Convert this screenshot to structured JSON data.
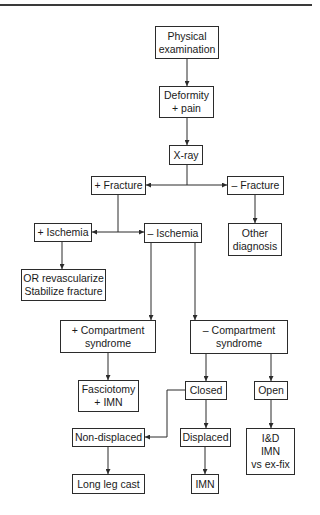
{
  "diagram": {
    "type": "flowchart",
    "colors": {
      "line": "#2b2b2b",
      "box_border": "#2b2b2b",
      "text": "#1a1a1a",
      "background": "#ffffff"
    },
    "nodes": {
      "physical_exam": {
        "lines": [
          "Physical",
          "examination"
        ]
      },
      "deformity": {
        "lines": [
          "Deformity",
          "+ pain"
        ]
      },
      "xray": {
        "lines": [
          "X-ray"
        ]
      },
      "pos_fracture": {
        "lines": [
          "+ Fracture"
        ]
      },
      "neg_fracture": {
        "lines": [
          "– Fracture"
        ]
      },
      "other_diagnosis": {
        "lines": [
          "Other",
          "diagnosis"
        ]
      },
      "pos_ischemia": {
        "lines": [
          "+ Ischemia"
        ]
      },
      "neg_ischemia": {
        "lines": [
          "– Ischemia"
        ]
      },
      "or_revascularize": {
        "lines": [
          "OR revascularize",
          "Stabilize fracture"
        ]
      },
      "pos_compartment": {
        "lines": [
          "+ Compartment",
          "syndrome"
        ]
      },
      "neg_compartment": {
        "lines": [
          "– Compartment",
          "syndrome"
        ]
      },
      "fasciotomy": {
        "lines": [
          "Fasciotomy",
          "+ IMN"
        ]
      },
      "closed": {
        "lines": [
          "Closed"
        ]
      },
      "open": {
        "lines": [
          "Open"
        ]
      },
      "non_displaced": {
        "lines": [
          "Non-displaced"
        ]
      },
      "displaced": {
        "lines": [
          "Displaced"
        ]
      },
      "id_imn": {
        "lines": [
          "I&D",
          "IMN",
          "vs ex-fix"
        ]
      },
      "long_leg_cast": {
        "lines": [
          "Long leg cast"
        ]
      },
      "imn": {
        "lines": [
          "IMN"
        ]
      }
    },
    "edges": [
      {
        "from": "physical_exam",
        "to": "deformity"
      },
      {
        "from": "deformity",
        "to": "xray"
      },
      {
        "from": "xray",
        "to": "pos_fracture"
      },
      {
        "from": "xray",
        "to": "neg_fracture"
      },
      {
        "from": "neg_fracture",
        "to": "other_diagnosis"
      },
      {
        "from": "pos_fracture",
        "to": "pos_ischemia"
      },
      {
        "from": "pos_fracture",
        "to": "neg_ischemia"
      },
      {
        "from": "pos_ischemia",
        "to": "or_revascularize"
      },
      {
        "from": "neg_ischemia",
        "to": "pos_compartment"
      },
      {
        "from": "neg_ischemia",
        "to": "neg_compartment"
      },
      {
        "from": "pos_compartment",
        "to": "fasciotomy"
      },
      {
        "from": "neg_compartment",
        "to": "closed"
      },
      {
        "from": "neg_compartment",
        "to": "open"
      },
      {
        "from": "closed",
        "to": "non_displaced"
      },
      {
        "from": "closed",
        "to": "displaced"
      },
      {
        "from": "open",
        "to": "id_imn"
      },
      {
        "from": "non_displaced",
        "to": "long_leg_cast"
      },
      {
        "from": "displaced",
        "to": "imn"
      }
    ]
  }
}
